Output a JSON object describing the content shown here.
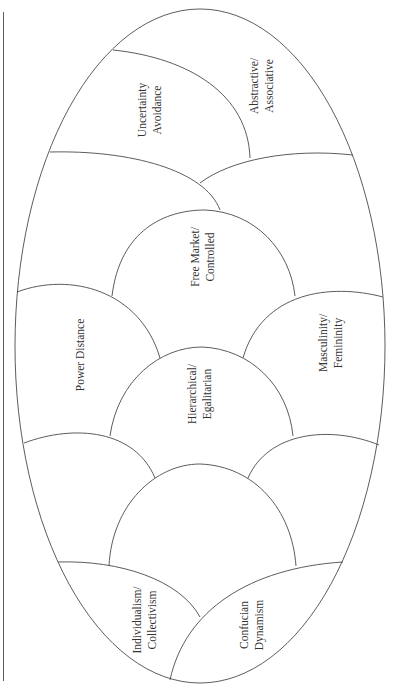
{
  "diagram": {
    "type": "cultural-dimensions-ellipse",
    "stroke_color": "#4a4a4a",
    "text_color": "#333333",
    "regions": [
      {
        "id": "uncertainty",
        "lines": [
          "Uncertainty",
          "Avoidance"
        ]
      },
      {
        "id": "abstractive",
        "lines": [
          "Abstractive/",
          "Associative"
        ]
      },
      {
        "id": "free-market",
        "lines": [
          "Free Market/",
          "Controlled"
        ]
      },
      {
        "id": "power-distance",
        "lines": [
          "Power Distance"
        ]
      },
      {
        "id": "hierarchical",
        "lines": [
          "Hierarchical/",
          "Egalitarian"
        ]
      },
      {
        "id": "masculinity",
        "lines": [
          "Masculinity/",
          "Femininity"
        ]
      },
      {
        "id": "individualism",
        "lines": [
          "Individualism/",
          "Collectivism"
        ]
      },
      {
        "id": "confucian",
        "lines": [
          "Confucian",
          "Dynamism"
        ]
      }
    ]
  }
}
